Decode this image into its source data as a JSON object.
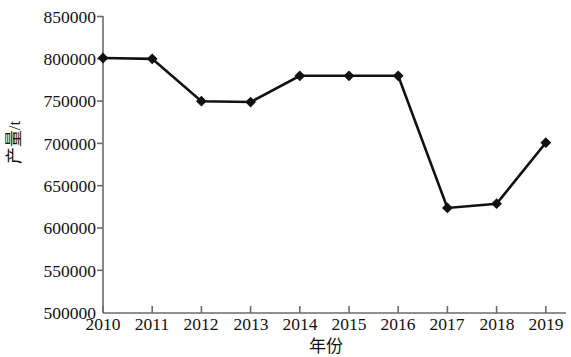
{
  "chart_data": {
    "type": "line",
    "title": "",
    "xlabel": "年份",
    "ylabel": "产量/t",
    "x": [
      "2010",
      "2011",
      "2012",
      "2013",
      "2014",
      "2015",
      "2016",
      "2017",
      "2018",
      "2019"
    ],
    "categories": [
      "2010",
      "2011",
      "2012",
      "2013",
      "2014",
      "2015",
      "2016",
      "2017",
      "2018",
      "2019"
    ],
    "values": [
      801000,
      800000,
      750000,
      749000,
      780000,
      780000,
      780000,
      624000,
      629000,
      701000
    ],
    "series": [
      {
        "name": "产量/t",
        "values": [
          801000,
          800000,
          750000,
          749000,
          780000,
          780000,
          780000,
          624000,
          629000,
          701000
        ],
        "marker": "diamond",
        "color": "#111111"
      }
    ],
    "ylim": [
      500000,
      850000
    ],
    "ytick_step": 50000,
    "ytick_labels": [
      "850000",
      "800000",
      "750000",
      "700000",
      "650000",
      "600000",
      "550000",
      "500000"
    ],
    "ytick_values": [
      850000,
      800000,
      750000,
      700000,
      650000,
      600000,
      550000,
      500000
    ],
    "xtick_labels": [
      "2010",
      "2011",
      "2012",
      "2013",
      "2014",
      "2015",
      "2016",
      "2017",
      "2018",
      "2019"
    ],
    "grid": false,
    "legend": "none",
    "line_color": "#111111",
    "axis_color": "#6b6b6b"
  }
}
